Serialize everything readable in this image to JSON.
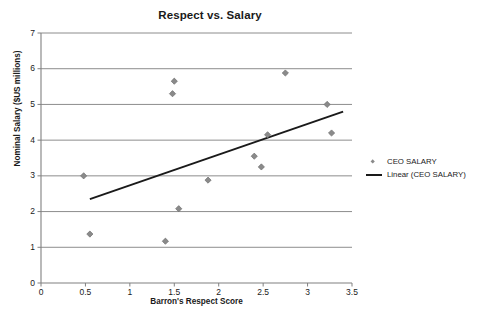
{
  "chart_data": {
    "type": "scatter",
    "title": "Respect vs. Salary",
    "xlabel": "Barron's Respect Score",
    "ylabel": "Nominal Salary ($US millions)",
    "xlim": [
      0,
      3.5
    ],
    "ylim": [
      0,
      7
    ],
    "xticks": [
      "0",
      "0.5",
      "1",
      "1.5",
      "2",
      "2.5",
      "3",
      "3.5"
    ],
    "xtick_values": [
      0,
      0.5,
      1,
      1.5,
      2,
      2.5,
      3,
      3.5
    ],
    "yticks": [
      "0",
      "1",
      "2",
      "3",
      "4",
      "5",
      "6",
      "7"
    ],
    "ytick_values": [
      0,
      1,
      2,
      3,
      4,
      5,
      6,
      7
    ],
    "grid": "horizontal",
    "legend_position": "right",
    "series": [
      {
        "name": "CEO SALARY",
        "type": "scatter",
        "marker": "diamond",
        "color": "#8a8a8a",
        "points": [
          {
            "x": 0.48,
            "y": 3.0
          },
          {
            "x": 0.55,
            "y": 1.37
          },
          {
            "x": 1.4,
            "y": 1.17
          },
          {
            "x": 1.48,
            "y": 5.3
          },
          {
            "x": 1.5,
            "y": 5.65
          },
          {
            "x": 1.55,
            "y": 2.08
          },
          {
            "x": 1.88,
            "y": 2.88
          },
          {
            "x": 2.4,
            "y": 3.55
          },
          {
            "x": 2.48,
            "y": 3.25
          },
          {
            "x": 2.55,
            "y": 4.15
          },
          {
            "x": 2.75,
            "y": 5.88
          },
          {
            "x": 3.22,
            "y": 5.0
          },
          {
            "x": 3.27,
            "y": 4.2
          }
        ]
      },
      {
        "name": "Linear (CEO SALARY)",
        "type": "line",
        "color": "#1a1a1a",
        "endpoints": [
          {
            "x": 0.55,
            "y": 2.35
          },
          {
            "x": 3.4,
            "y": 4.8
          }
        ]
      }
    ],
    "legend": [
      {
        "label": "CEO SALARY",
        "key": "diamond-marker"
      },
      {
        "label": "Linear (CEO SALARY)",
        "key": "line-swatch"
      }
    ],
    "colors": {
      "marker": "#8a8a8a",
      "trendline": "#1a1a1a",
      "gridline": "#808080",
      "axis": "#808080",
      "text": "#1a1a1a",
      "background": "#ffffff"
    }
  }
}
